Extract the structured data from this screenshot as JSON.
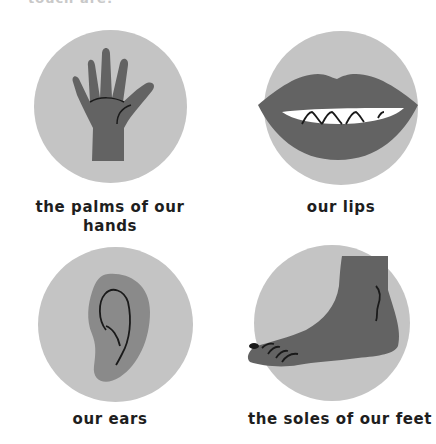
{
  "page": {
    "top_partial_text": "touch are:",
    "circle_color": "#c4c4c4",
    "figure_color": "#636363",
    "line_color": "#1a1a1a"
  },
  "items": [
    {
      "label": "the palms of our hands",
      "line1": "the palms of our",
      "line2": "hands",
      "icon": "hand-icon"
    },
    {
      "label": "our lips",
      "line1": "our lips",
      "icon": "lips-icon"
    },
    {
      "label": "our ears",
      "line1": "our ears",
      "icon": "ear-icon"
    },
    {
      "label": "the soles of our feet",
      "line1": "the soles of our feet",
      "icon": "foot-icon"
    }
  ]
}
